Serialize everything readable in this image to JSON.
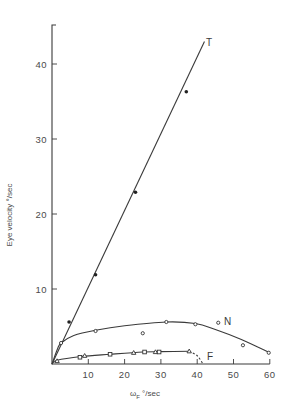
{
  "chart_data": {
    "type": "scatter",
    "title": "",
    "xlabel": "ωF °/sec",
    "xlabel_main": "ω",
    "xlabel_sub": "F",
    "xlabel_unit": "°/sec",
    "ylabel": "Eye velocity °/sec",
    "xlim": [
      0,
      60
    ],
    "ylim": [
      0,
      45
    ],
    "xticks": [
      10,
      20,
      30,
      40,
      50,
      60
    ],
    "yticks": [
      10,
      20,
      30,
      40
    ],
    "grid": false,
    "legend": "inline labels at curve ends",
    "series": [
      {
        "name": "T",
        "marker": "filled-circle",
        "fit": "linear",
        "points": [
          [
            4.7,
            5.6
          ],
          [
            12,
            11.9
          ],
          [
            23,
            22.9
          ],
          [
            37,
            36.3
          ]
        ],
        "curve": [
          [
            0,
            0
          ],
          [
            42,
            43
          ]
        ]
      },
      {
        "name": "N",
        "marker": "open-circle",
        "fit": "smooth",
        "points": [
          [
            2.5,
            2.8
          ],
          [
            12,
            4.4
          ],
          [
            25,
            4.1
          ],
          [
            31.5,
            5.6
          ],
          [
            39.5,
            5.3
          ],
          [
            45.8,
            5.5
          ],
          [
            52.6,
            2.5
          ],
          [
            59.7,
            1.5
          ]
        ],
        "curve": [
          [
            0,
            0
          ],
          [
            1.5,
            2.0
          ],
          [
            2.5,
            2.8
          ],
          [
            6,
            3.8
          ],
          [
            12,
            4.5
          ],
          [
            20,
            5.1
          ],
          [
            31.5,
            5.6
          ],
          [
            39.5,
            5.4
          ],
          [
            45,
            4.6
          ],
          [
            52,
            3.3
          ],
          [
            60,
            1.5
          ]
        ]
      },
      {
        "name": "F",
        "marker": "open-triangle/square",
        "fit": "smooth",
        "points": [
          [
            1.4,
            0.4
          ],
          [
            7.7,
            0.9
          ],
          [
            9,
            1.1
          ],
          [
            16,
            1.3
          ],
          [
            22.5,
            1.5
          ],
          [
            25.5,
            1.6
          ],
          [
            28.5,
            1.6
          ],
          [
            29.5,
            1.6
          ],
          [
            37.8,
            1.7
          ]
        ],
        "curve": [
          [
            0,
            0
          ],
          [
            1.4,
            0.5
          ],
          [
            8,
            1.0
          ],
          [
            16,
            1.3
          ],
          [
            25,
            1.6
          ],
          [
            30,
            1.65
          ],
          [
            37.8,
            1.7
          ]
        ],
        "extrapolation_dashed": [
          [
            37.8,
            1.7
          ],
          [
            40,
            1.1
          ],
          [
            41.6,
            0
          ]
        ]
      }
    ]
  },
  "plot": {
    "origin_px": [
      52,
      364
    ],
    "x_px_per_unit": 3.63,
    "y_px_per_unit": 7.5,
    "y_axis_top_px": 25
  }
}
